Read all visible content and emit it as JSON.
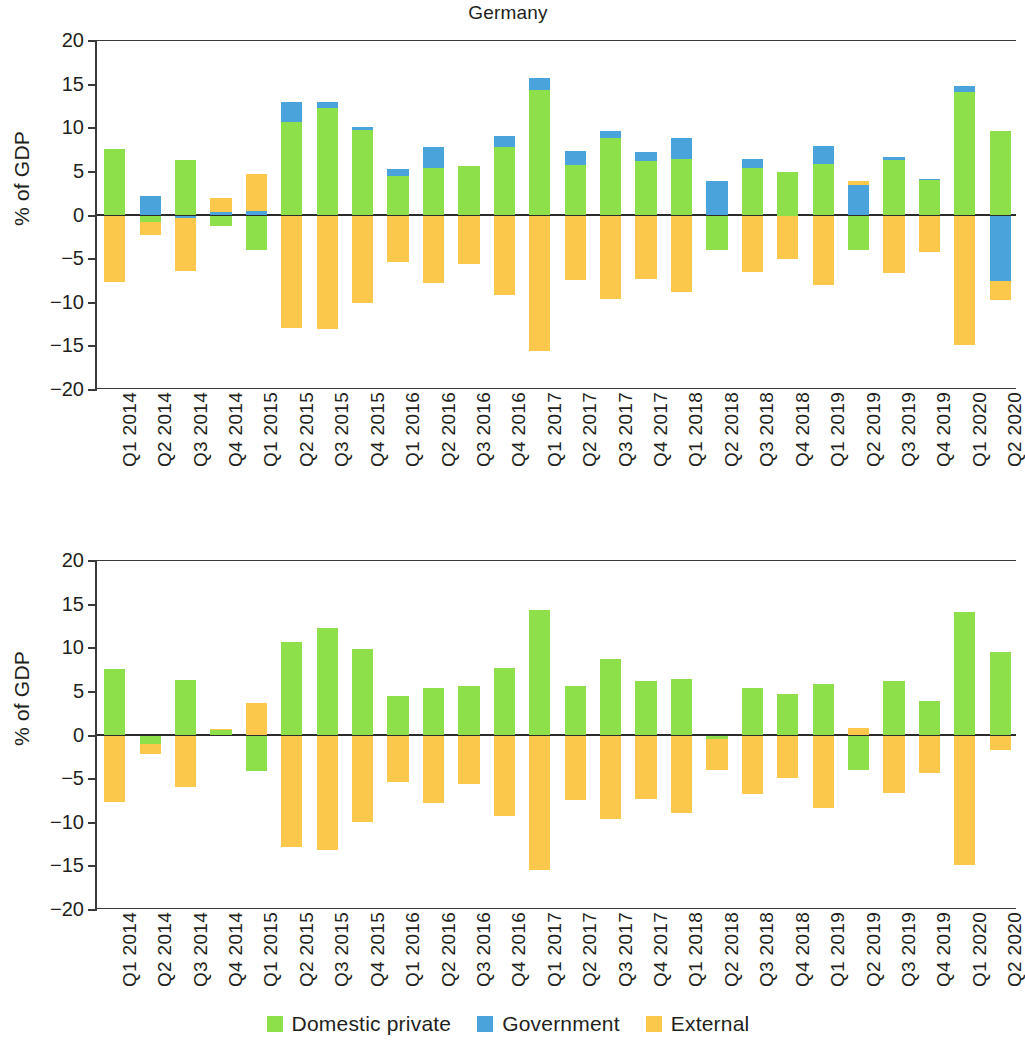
{
  "chart_data": [
    {
      "type": "bar",
      "stacked": true,
      "title": "Germany",
      "xlabel": "",
      "ylabel": "% of GDP",
      "ylim": [
        -20,
        20
      ],
      "yticks": [
        20,
        15,
        10,
        5,
        0,
        -5,
        -10,
        -15,
        -20
      ],
      "ytick_labels": [
        "20",
        "15",
        "10",
        "5",
        "0",
        "−5",
        "−10",
        "−15",
        "−20"
      ],
      "grid": false,
      "legend": "bottom",
      "categories": [
        "Q1 2014",
        "Q2 2014",
        "Q3 2014",
        "Q4 2014",
        "Q1 2015",
        "Q2 2015",
        "Q3 2015",
        "Q4 2015",
        "Q1 2016",
        "Q2 2016",
        "Q3 2016",
        "Q4 2016",
        "Q1 2017",
        "Q2 2017",
        "Q3 2017",
        "Q4 2017",
        "Q1 2018",
        "Q2 2018",
        "Q3 2018",
        "Q4 2018",
        "Q1 2019",
        "Q2 2019",
        "Q3 2019",
        "Q4 2019",
        "Q1 2020",
        "Q2 2020"
      ],
      "series": [
        {
          "name": "Domestic private",
          "color": "#8EE04B",
          "values": [
            7.6,
            -0.7,
            6.4,
            -1.2,
            -4.0,
            10.7,
            12.3,
            9.8,
            4.5,
            5.5,
            5.7,
            7.8,
            14.4,
            5.8,
            8.9,
            6.3,
            6.5,
            -3.9,
            5.5,
            5.0,
            5.9,
            -4.0,
            6.4,
            4.1,
            14.2,
            9.7
          ]
        },
        {
          "name": "Government",
          "color": "#4BA3DC",
          "values": [
            0.0,
            2.2,
            -0.3,
            0.4,
            0.5,
            2.3,
            0.7,
            0.3,
            0.8,
            2.3,
            0.0,
            1.3,
            1.4,
            1.6,
            0.8,
            1.0,
            2.4,
            3.9,
            1.0,
            0.0,
            2.1,
            3.5,
            0.3,
            0.1,
            0.6,
            -7.5
          ]
        },
        {
          "name": "External",
          "color": "#FBC84B",
          "values": [
            -7.6,
            -1.5,
            -6.1,
            1.6,
            4.2,
            -12.9,
            -13.0,
            -10.0,
            -5.3,
            -7.7,
            -5.6,
            -9.1,
            -15.5,
            -7.4,
            -9.6,
            -7.3,
            -8.8,
            0.0,
            -6.5,
            -5.0,
            -8.0,
            0.5,
            -6.6,
            -4.2,
            -14.8,
            -2.2
          ]
        }
      ]
    },
    {
      "type": "bar",
      "stacked": true,
      "title": "",
      "xlabel": "",
      "ylabel": "% of GDP",
      "ylim": [
        -20,
        20
      ],
      "yticks": [
        20,
        15,
        10,
        5,
        0,
        -5,
        -10,
        -15,
        -20
      ],
      "ytick_labels": [
        "20",
        "15",
        "10",
        "5",
        "0",
        "−5",
        "−10",
        "−15",
        "−20"
      ],
      "grid": false,
      "legend": "bottom",
      "categories": [
        "Q1 2014",
        "Q2 2014",
        "Q3 2014",
        "Q4 2014",
        "Q1 2015",
        "Q2 2015",
        "Q3 2015",
        "Q4 2015",
        "Q1 2016",
        "Q2 2016",
        "Q3 2016",
        "Q4 2016",
        "Q1 2017",
        "Q2 2017",
        "Q3 2017",
        "Q4 2017",
        "Q1 2018",
        "Q2 2018",
        "Q3 2018",
        "Q4 2018",
        "Q1 2019",
        "Q2 2019",
        "Q3 2019",
        "Q4 2019",
        "Q1 2020",
        "Q2 2020"
      ],
      "series": [
        {
          "name": "Domestic private",
          "color": "#8EE04B",
          "values": [
            7.6,
            -1.0,
            6.4,
            0.6,
            -4.1,
            10.7,
            12.3,
            9.9,
            4.5,
            5.4,
            5.7,
            7.7,
            14.4,
            5.7,
            8.8,
            6.3,
            6.5,
            -0.4,
            5.4,
            4.8,
            5.9,
            -3.9,
            6.3,
            4.0,
            14.2,
            9.6
          ]
        },
        {
          "name": "External",
          "color": "#FBC84B",
          "values": [
            -7.6,
            -1.1,
            -5.9,
            0.2,
            3.7,
            -12.8,
            -13.1,
            -9.9,
            -5.3,
            -7.7,
            -5.6,
            -9.2,
            -15.4,
            -7.4,
            -9.6,
            -7.3,
            -8.9,
            -3.6,
            -6.7,
            -4.9,
            -8.3,
            0.9,
            -6.6,
            -4.3,
            -14.8,
            -1.7
          ]
        }
      ]
    }
  ],
  "panels": [
    {
      "id": "top",
      "title": "Germany",
      "ylabel": "% of GDP"
    },
    {
      "id": "bottom",
      "title": "",
      "ylabel": "% of GDP"
    }
  ],
  "legend": {
    "items": [
      {
        "label": "Domestic private",
        "color": "#8EE04B",
        "swatch_name": "legend-swatch-domestic-private"
      },
      {
        "label": "Government",
        "color": "#4BA3DC",
        "swatch_name": "legend-swatch-government"
      },
      {
        "label": "External",
        "color": "#FBC84B",
        "swatch_name": "legend-swatch-external"
      }
    ]
  },
  "colors": {
    "domestic_private": "#8EE04B",
    "government": "#4BA3DC",
    "external": "#FBC84B",
    "axis": "#2b2b2b",
    "text": "#231f20",
    "background": "#ffffff"
  }
}
